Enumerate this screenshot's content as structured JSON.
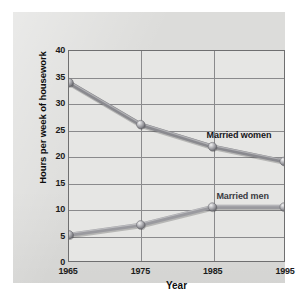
{
  "chart_data": {
    "type": "line",
    "title": "",
    "xlabel": "Year",
    "ylabel": "Hours per week of housework",
    "x": [
      1965,
      1975,
      1985,
      1995
    ],
    "categories": [
      "1965",
      "1975",
      "1985",
      "1995"
    ],
    "xlim": [
      1965,
      1995
    ],
    "ylim": [
      0,
      40
    ],
    "yticks": [
      0,
      5,
      10,
      15,
      20,
      25,
      30,
      35,
      40
    ],
    "ytick_labels": [
      "0",
      "5",
      "10",
      "15",
      "20",
      "25",
      "30",
      "35",
      "40"
    ],
    "xtick_labels": [
      "1965",
      "1975",
      "1985",
      "1995"
    ],
    "grid": "horizontal-and-vertical",
    "legend_position": "inline-annotation",
    "series": [
      {
        "name": "Married women",
        "label": "Married women",
        "values": [
          34,
          26,
          21.8,
          19
        ],
        "color": "#8a8a8f",
        "label_x": 1988.5,
        "label_y": 24.2
      },
      {
        "name": "Married men",
        "label": "Married men",
        "values": [
          5,
          6.9,
          10.3,
          10.3
        ],
        "color": "#9a9a9f",
        "label_x": 1989.0,
        "label_y": 12.6
      }
    ]
  },
  "colors": {
    "page_background": "#ffffff",
    "card_background": "#dcdcda",
    "plot_background": "#e6e6e4",
    "gridline": "#8a8a8c",
    "axis_frame": "#6f6f70",
    "series_line": "#8a8a8f",
    "marker_fill": "#9d9da2",
    "text": "#1b1b1b"
  }
}
